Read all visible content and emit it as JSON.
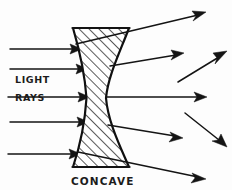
{
  "diagram": {
    "background_color": "#fdfdfd",
    "ink_color": "#141414",
    "labels": {
      "light": "LIGHT",
      "rays": "RAYS",
      "concave": "CONCAVE"
    },
    "lens": {
      "name": "concave-lens",
      "type": "biconcave",
      "hatched": true,
      "hatch_direction": "forward-slash",
      "top_y": 27,
      "bottom_y": 168,
      "left_edge_x": 72,
      "right_edge_x": 128,
      "waist_left_x": 86,
      "waist_right_x": 106,
      "waist_y": 98
    },
    "incoming_rays": [
      {
        "id": "in-1",
        "x1": 10,
        "y1": 49,
        "x2": 80,
        "y2": 49
      },
      {
        "id": "in-2",
        "x1": 10,
        "y1": 69,
        "x2": 86,
        "y2": 69
      },
      {
        "id": "in-3",
        "x1": 8,
        "y1": 97,
        "x2": 88,
        "y2": 97
      },
      {
        "id": "in-4",
        "x1": 10,
        "y1": 122,
        "x2": 87,
        "y2": 122
      },
      {
        "id": "in-5",
        "x1": 8,
        "y1": 154,
        "x2": 79,
        "y2": 154
      }
    ],
    "outgoing_rays": [
      {
        "id": "out-1",
        "x1": 76,
        "y1": 44,
        "x2": 204,
        "y2": 13
      },
      {
        "id": "out-2",
        "x1": 110,
        "y1": 66,
        "x2": 182,
        "y2": 54
      },
      {
        "id": "out-3",
        "x1": 106,
        "y1": 97,
        "x2": 205,
        "y2": 97
      },
      {
        "id": "out-4",
        "x1": 108,
        "y1": 125,
        "x2": 181,
        "y2": 137
      },
      {
        "id": "out-5",
        "x1": 78,
        "y1": 152,
        "x2": 204,
        "y2": 178
      }
    ],
    "free_rays": [
      {
        "id": "free-1",
        "x1": 178,
        "y1": 82,
        "x2": 226,
        "y2": 52
      },
      {
        "id": "free-2",
        "x1": 185,
        "y1": 113,
        "x2": 226,
        "y2": 146
      }
    ]
  }
}
